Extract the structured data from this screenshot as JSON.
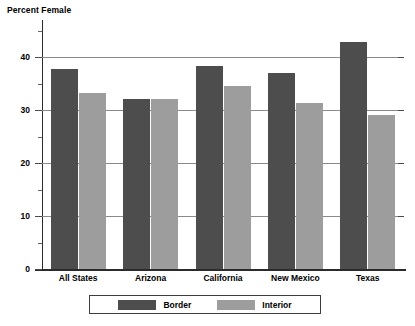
{
  "chart_data": {
    "type": "bar",
    "title": "Percent Female",
    "ylabel": "Percent Female",
    "xlabel": "",
    "categories": [
      "All States",
      "Arizona",
      "California",
      "New Mexico",
      "Texas"
    ],
    "series": [
      {
        "name": "Border",
        "color": "#4d4d4d",
        "values": [
          37.8,
          32.0,
          38.3,
          37.0,
          42.8
        ]
      },
      {
        "name": "Interior",
        "color": "#9d9d9d",
        "values": [
          33.3,
          32.1,
          34.6,
          31.4,
          29.1
        ]
      }
    ],
    "ylim": [
      0,
      47
    ],
    "ytick_labels": [
      "0",
      "10",
      "20",
      "30",
      "40"
    ],
    "ytick_values": [
      0,
      10,
      20,
      30,
      40
    ],
    "yminor_values": [
      5,
      15,
      25,
      35,
      45
    ],
    "grid": "horizontal-major",
    "legend_position": "bottom",
    "legend_entries": [
      "Border",
      "Interior"
    ]
  }
}
